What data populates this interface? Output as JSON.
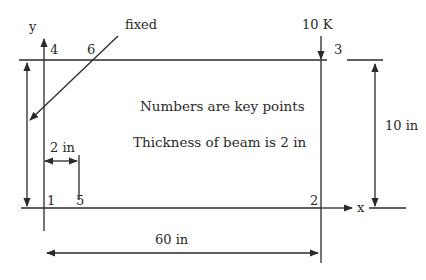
{
  "diagram": {
    "labels": {
      "y_axis": "y",
      "x_axis": "x",
      "fixed": "fixed",
      "load": "10 K",
      "note_keypoints": "Numbers are key points",
      "note_thickness": "Thickness of beam is 2 in",
      "dim_width": "2 in",
      "dim_height": "10 in",
      "dim_length": "60 in"
    },
    "key_points": [
      {
        "id": "1",
        "label": "1"
      },
      {
        "id": "2",
        "label": "2"
      },
      {
        "id": "3",
        "label": "3"
      },
      {
        "id": "4",
        "label": "4"
      },
      {
        "id": "5",
        "label": "5"
      },
      {
        "id": "6",
        "label": "6"
      }
    ],
    "colors": {
      "stroke": "#2a2a2a",
      "background": "#ffffff"
    }
  }
}
